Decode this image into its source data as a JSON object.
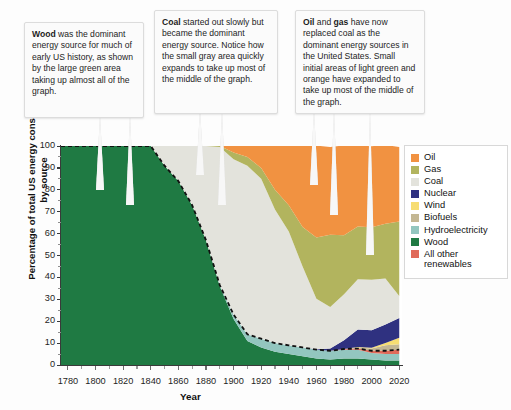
{
  "figure": {
    "background": "#fdfdfd"
  },
  "callouts": [
    {
      "id": "callout-wood",
      "bold_lead": "Wood",
      "text": " was the dominant energy source for much of early US history, as shown by the large green area taking up almost all of the graph."
    },
    {
      "id": "callout-coal",
      "bold_lead": "Coal",
      "text": " started out slowly but became the dominant energy source. Notice how the small gray area quickly expands to take up most of the middle of the graph."
    },
    {
      "id": "callout-oil-gas",
      "bold_lead": "Oil",
      "mid_text": " and ",
      "bold_lead2": "gas",
      "text": " have now replaced coal as the dominant energy sources in the United States. Small initial areas of light green and orange have expanded to take up most of the middle of the graph."
    }
  ],
  "legend": {
    "title": "",
    "items": [
      {
        "label": "Oil",
        "color": "#f19241"
      },
      {
        "label": "Gas",
        "color": "#b2b45e"
      },
      {
        "label": "Coal",
        "color": "#e3e3dc"
      },
      {
        "label": "Nuclear",
        "color": "#2f3180"
      },
      {
        "label": "Wind",
        "color": "#f7dd72"
      },
      {
        "label": "Biofuels",
        "color": "#c4b793"
      },
      {
        "label": "Hydroelectricity",
        "color": "#93c6bf"
      },
      {
        "label": "Wood",
        "color": "#1f7a43"
      },
      {
        "label": "All other\nrenewables",
        "color": "#e06a5a"
      }
    ]
  },
  "chart_data": {
    "type": "area",
    "stacked": true,
    "title": "",
    "xlabel": "Year",
    "ylabel": "Percentage of total US energy consumption by source",
    "xlim": [
      1775,
      2022
    ],
    "ylim": [
      0,
      100
    ],
    "grid": false,
    "legend_position": "right",
    "y_ticks": [
      0,
      10,
      20,
      30,
      40,
      50,
      60,
      70,
      80,
      90,
      100
    ],
    "x_ticks": [
      1780,
      1800,
      1820,
      1840,
      1860,
      1880,
      1900,
      1920,
      1940,
      1960,
      1980,
      2000,
      2020
    ],
    "annotation_dashed_line": "boundary between Wood and the fossil/other layers",
    "stack_order_bottom_to_top": [
      "Wood",
      "Hydroelectricity",
      "All other renewables",
      "Biofuels",
      "Wind",
      "Nuclear",
      "Coal",
      "Gas",
      "Oil"
    ],
    "x": [
      1775,
      1790,
      1800,
      1810,
      1820,
      1830,
      1840,
      1850,
      1860,
      1870,
      1880,
      1890,
      1900,
      1910,
      1920,
      1930,
      1940,
      1950,
      1960,
      1970,
      1980,
      1990,
      2000,
      2010,
      2020
    ],
    "series": [
      {
        "name": "Wood",
        "color": "#1f7a43",
        "values": [
          100,
          100,
          100,
          100,
          100,
          100,
          100,
          91,
          84,
          73,
          57,
          36,
          21,
          11,
          8,
          6,
          5,
          4,
          3,
          2.5,
          3,
          3,
          2.5,
          2,
          2
        ]
      },
      {
        "name": "Hydroelectricity",
        "color": "#93c6bf",
        "values": [
          0,
          0,
          0,
          0,
          0,
          0,
          0,
          0,
          0,
          0,
          0,
          0.5,
          2,
          3,
          4,
          4,
          4,
          4,
          4,
          4,
          4,
          4,
          3,
          3,
          3
        ]
      },
      {
        "name": "All other renewables",
        "color": "#e06a5a",
        "values": [
          0,
          0,
          0,
          0,
          0,
          0,
          0,
          0,
          0,
          0,
          0,
          0,
          0,
          0,
          0,
          0,
          0,
          0,
          0,
          0,
          0.3,
          0.5,
          1,
          1.5,
          2
        ]
      },
      {
        "name": "Biofuels",
        "color": "#c4b793",
        "values": [
          0,
          0,
          0,
          0,
          0,
          0,
          0,
          0,
          0,
          0,
          0,
          0,
          0,
          0,
          0,
          0,
          0,
          0,
          0,
          0,
          0,
          0.5,
          1,
          2.5,
          2.5
        ]
      },
      {
        "name": "Wind",
        "color": "#f7dd72",
        "values": [
          0,
          0,
          0,
          0,
          0,
          0,
          0,
          0,
          0,
          0,
          0,
          0,
          0,
          0,
          0,
          0,
          0,
          0,
          0,
          0,
          0,
          0.2,
          0.4,
          1,
          3
        ]
      },
      {
        "name": "Nuclear",
        "color": "#2f3180",
        "values": [
          0,
          0,
          0,
          0,
          0,
          0,
          0,
          0,
          0,
          0,
          0,
          0,
          0,
          0,
          0,
          0,
          0,
          0,
          0.2,
          1,
          4,
          8,
          8,
          8.5,
          9
        ]
      },
      {
        "name": "Coal",
        "color": "#e3e3dc",
        "values": [
          0,
          0,
          0,
          0,
          0,
          0,
          0,
          9,
          16,
          27,
          43,
          63,
          71,
          77,
          73,
          61,
          52,
          37,
          23,
          19,
          21,
          23,
          23,
          21,
          10
        ]
      },
      {
        "name": "Gas",
        "color": "#b2b45e",
        "values": [
          0,
          0,
          0,
          0,
          0,
          0,
          0,
          0,
          0,
          0,
          0,
          0.5,
          3,
          4,
          5,
          9,
          12,
          18,
          28,
          33,
          27,
          24,
          24,
          25,
          34
        ]
      },
      {
        "name": "Oil",
        "color": "#f19241",
        "values": [
          0,
          0,
          0,
          0,
          0,
          0,
          0,
          0,
          0,
          0,
          0,
          0,
          3,
          5,
          10,
          20,
          27,
          37,
          42,
          40,
          41,
          37,
          37,
          36,
          34
        ]
      }
    ]
  }
}
